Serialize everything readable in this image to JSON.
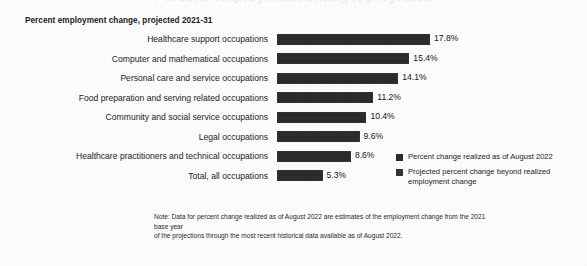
{
  "clipped_title": "Percent employment change, projected",
  "subtitle": "Percent employment change, projected 2021-31",
  "chart_data": {
    "type": "bar",
    "title": "Percent employment change, projected 2021-31",
    "xlabel": "",
    "ylabel": "",
    "orientation": "horizontal",
    "grid": false,
    "legend_position": "right",
    "xlim": [
      0,
      17.8
    ],
    "categories": [
      "Healthcare support occupations",
      "Computer and mathematical occupations",
      "Personal care and service occupations",
      "Food preparation and serving related occupations",
      "Community and social service occupations",
      "Legal occupations",
      "Healthcare practitioners and technical occupations",
      "Total, all occupations"
    ],
    "values": [
      17.8,
      15.4,
      14.1,
      11.2,
      10.4,
      9.6,
      8.6,
      5.3
    ],
    "value_labels": [
      "17.8%",
      "15.4%",
      "14.1%",
      "11.2%",
      "10.4%",
      "9.6%",
      "8.6%",
      "5.3%"
    ],
    "series": [
      {
        "name": "Percent change realized as of August 2022",
        "color": "#2b2b2b"
      },
      {
        "name": "Projected percent change beyond realized employment change",
        "color": "#343434"
      }
    ]
  },
  "legend": [
    {
      "label": "Percent change realized as of August 2022",
      "color": "#2b2b2b"
    },
    {
      "label": "Projected percent change beyond realized employment change",
      "color": "#343434"
    }
  ],
  "footnote": {
    "line1": "Note: Data for percent change realized as of August 2022 are estimates of the employment change from the 2021 base year",
    "line2": "of the projections through the most recent historical data available as of August 2022."
  }
}
